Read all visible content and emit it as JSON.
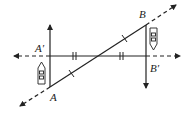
{
  "diagram": {
    "type": "geometry-reflection",
    "labels": {
      "A": "A",
      "A_prime": "A′",
      "B": "B",
      "B_prime": "B′"
    },
    "points": {
      "A": [
        50,
        87
      ],
      "A_prime": [
        50,
        56
      ],
      "B": [
        146,
        25
      ],
      "B_prime": [
        146,
        56
      ]
    },
    "icons": [
      "boat-icon-left",
      "boat-icon-right"
    ],
    "colors": {
      "stroke": "#222222",
      "background": "#ffffff"
    }
  }
}
